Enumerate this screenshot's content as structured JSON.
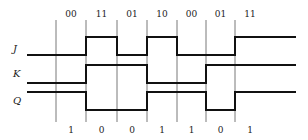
{
  "diagram": {
    "type": "timing-diagram",
    "top_labels": [
      "00",
      "11",
      "01",
      "10",
      "00",
      "01",
      "11"
    ],
    "bottom_labels": [
      "1",
      "0",
      "0",
      "1",
      "1",
      "0",
      "1"
    ],
    "signals": [
      {
        "name": "J",
        "levels": [
          0,
          0,
          1,
          0,
          1,
          0,
          0,
          1,
          1
        ]
      },
      {
        "name": "K",
        "levels": [
          0,
          0,
          1,
          1,
          0,
          0,
          1,
          1,
          1
        ]
      },
      {
        "name": "Q",
        "levels": [
          1,
          1,
          0,
          0,
          1,
          1,
          0,
          1,
          1
        ]
      }
    ],
    "clock_edges_x": [
      56,
      86,
      117,
      147,
      177,
      206,
      235
    ],
    "colors": {
      "wave": "#111111",
      "grid": "#555555",
      "text": "#222222"
    }
  }
}
